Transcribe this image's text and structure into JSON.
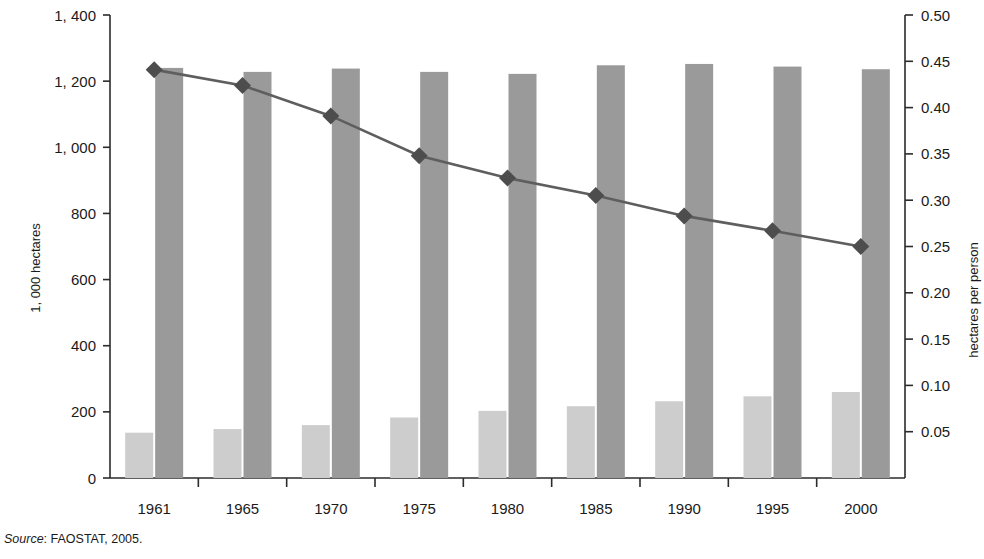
{
  "source_note": {
    "label": "Source",
    "separator": ": ",
    "text": "FAOSTAT, 2005."
  },
  "axes": {
    "left_title": "1, 000 hectares",
    "right_title": "hectares per person",
    "left_ticks": [
      "0",
      "200",
      "400",
      "600",
      "800",
      "1, 000",
      "1, 200",
      "1, 400"
    ],
    "right_ticks": [
      "0.05",
      "0.10",
      "0.15",
      "0.20",
      "0.25",
      "0.30",
      "0.35",
      "0.40",
      "0.45",
      "0.50"
    ],
    "x_ticks": [
      "1961",
      "1965",
      "1970",
      "1975",
      "1980",
      "1985",
      "1990",
      "1995",
      "2000"
    ]
  },
  "colors": {
    "bar_light": "#cdcdcd",
    "bar_dark": "#9a9a9a",
    "line": "#5e5e5e",
    "marker": "#4d4d4d",
    "axis": "#2b2b2b",
    "text": "#1a1a1a"
  },
  "chart_data": {
    "type": "bar",
    "title": "",
    "xlabel": "",
    "ylabel": "1, 000 hectares",
    "y2label": "hectares per person",
    "categories": [
      "1961",
      "1965",
      "1970",
      "1975",
      "1980",
      "1985",
      "1990",
      "1995",
      "2000"
    ],
    "ylim": [
      0,
      1400
    ],
    "y2lim": [
      0,
      0.5
    ],
    "grid": false,
    "legend": "none",
    "series": [
      {
        "name": "light-bars",
        "type": "bar",
        "axis": "left",
        "color": "#cdcdcd",
        "values": [
          137,
          148,
          160,
          183,
          203,
          217,
          232,
          247,
          260
        ]
      },
      {
        "name": "dark-bars",
        "type": "bar",
        "axis": "left",
        "color": "#9a9a9a",
        "values": [
          1240,
          1228,
          1238,
          1228,
          1222,
          1248,
          1252,
          1244,
          1236
        ]
      },
      {
        "name": "hectares-per-person",
        "type": "line",
        "axis": "right",
        "color": "#5e5e5e",
        "marker": "diamond",
        "values": [
          0.441,
          0.424,
          0.391,
          0.348,
          0.324,
          0.305,
          0.283,
          0.267,
          0.25
        ]
      }
    ]
  }
}
